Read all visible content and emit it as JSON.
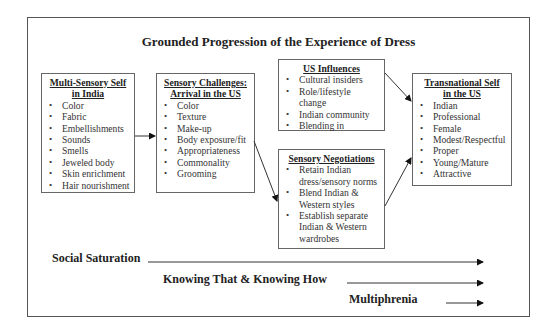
{
  "title": "Grounded Progression of the Experience of Dress",
  "boxes": {
    "india": {
      "title_line1": "Multi-Sensory Self",
      "title_line2": "in India",
      "items": [
        "Color",
        "Fabric",
        "Embellishments",
        "Sounds",
        "Smells",
        "Jeweled body",
        "Skin enrichment",
        "Hair nourishment"
      ]
    },
    "challenges": {
      "title_line1": "Sensory Challenges:",
      "title_line2": "Arrival in the US",
      "items": [
        "Color",
        "Texture",
        "Make-up",
        "Body exposure/fit",
        "Appropriateness",
        "Commonality",
        "Grooming"
      ]
    },
    "influences": {
      "title_line1": "US Influences",
      "items": [
        "Cultural insiders",
        "Role/lifestyle change",
        "Indian community",
        "Blending in"
      ]
    },
    "negotiations": {
      "title_line1": "Sensory Negotiations",
      "items": [
        "Retain Indian dress/sensory norms",
        "Blend Indian & Western styles",
        "Establish separate Indian & Western wardrobes"
      ]
    },
    "transnational": {
      "title_line1": "Transnational Self",
      "title_line2": "in the US",
      "items": [
        "Indian",
        "Professional",
        "Female",
        "Modest/Respectful",
        "Proper",
        "Young/Mature",
        "Attractive"
      ]
    }
  },
  "flows": {
    "social_saturation": "Social Saturation",
    "knowing": "Knowing That & Knowing How",
    "multiphrenia": "Multiphrenia"
  }
}
